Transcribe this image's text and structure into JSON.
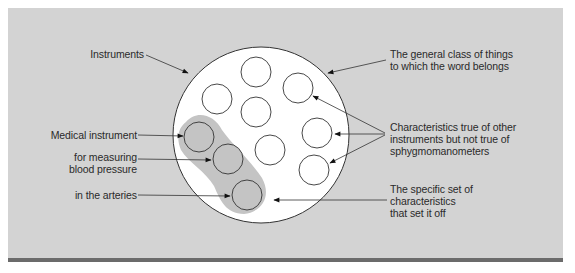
{
  "diagram": {
    "type": "concept-definition-circle",
    "colors": {
      "panel": "#d3d3d3",
      "band": "#6b6b6b",
      "circle_fill": "#ffffff",
      "highlight": "#c4c4c4",
      "stroke": "#333333",
      "text": "#2a2a2a"
    },
    "outer_circle": {
      "label": "Instruments",
      "cx": 261,
      "cy": 135,
      "r": 88
    },
    "small_circles": [
      {
        "cx": 256,
        "cy": 72,
        "r": 15,
        "highlighted": false
      },
      {
        "cx": 217,
        "cy": 99,
        "r": 15,
        "highlighted": false
      },
      {
        "cx": 298,
        "cy": 88,
        "r": 15,
        "highlighted": false
      },
      {
        "cx": 256,
        "cy": 112,
        "r": 15,
        "highlighted": false
      },
      {
        "cx": 199,
        "cy": 137,
        "r": 15,
        "highlighted": true
      },
      {
        "cx": 317,
        "cy": 133,
        "r": 15,
        "highlighted": false
      },
      {
        "cx": 228,
        "cy": 159,
        "r": 15,
        "highlighted": true
      },
      {
        "cx": 270,
        "cy": 150,
        "r": 15,
        "highlighted": false
      },
      {
        "cx": 314,
        "cy": 170,
        "r": 15,
        "highlighted": false
      },
      {
        "cx": 247,
        "cy": 195,
        "r": 15,
        "highlighted": true
      }
    ],
    "left_labels": {
      "instruments": "Instruments",
      "medical_instrument": "Medical instrument",
      "measuring_line1": "for measuring",
      "measuring_line2": "blood pressure",
      "arteries": "in the arteries"
    },
    "right_labels": {
      "general_class_line1": "The general class of things",
      "general_class_line2": "to which the word belongs",
      "characteristics_line1": "Characteristics true of other",
      "characteristics_line2": "instruments but not true of",
      "characteristics_line3": "sphygmomanometers",
      "specific_set_line1": "The specific set of",
      "specific_set_line2": "characteristics",
      "specific_set_line3": "that set it off"
    }
  }
}
